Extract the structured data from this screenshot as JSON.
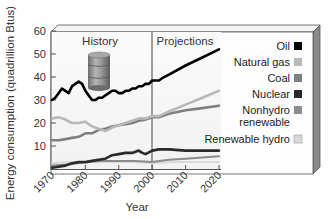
{
  "chart_data": {
    "type": "line",
    "title": "",
    "xlabel": "Year",
    "ylabel": "Energy consumption (quadrillion Btus)",
    "xlim": [
      1970,
      2020
    ],
    "ylim": [
      0,
      60
    ],
    "x_ticks": [
      1970,
      1980,
      1990,
      2000,
      2010,
      2020
    ],
    "y_ticks": [
      10,
      20,
      30,
      40,
      50,
      60
    ],
    "grid": false,
    "legend_position": "right, inside",
    "annotations": [
      {
        "text": "History",
        "x": 1984
      },
      {
        "text": "Projections",
        "x": 2009
      },
      {
        "type": "vertical-divider",
        "x": 2000
      },
      {
        "type": "oil-barrel-illustration",
        "x": 1985
      }
    ],
    "series": [
      {
        "name": "Oil",
        "color": "#000000",
        "x": [
          1970,
          1971,
          1972,
          1973,
          1974,
          1975,
          1976,
          1977,
          1978,
          1979,
          1980,
          1981,
          1982,
          1983,
          1984,
          1985,
          1986,
          1987,
          1988,
          1989,
          1990,
          1991,
          1992,
          1993,
          1994,
          1995,
          1996,
          1997,
          1998,
          1999,
          2000,
          2001,
          2002,
          2003,
          2005,
          2010,
          2015,
          2020
        ],
        "values": [
          30,
          31,
          33,
          35,
          34,
          33,
          36,
          37,
          38,
          37,
          34,
          32,
          30,
          30,
          31,
          31,
          32,
          33,
          34,
          34,
          33,
          33,
          34,
          34,
          35,
          35,
          36,
          36,
          37,
          37,
          38.5,
          38.5,
          38.5,
          39.5,
          41,
          45,
          48.5,
          52
        ]
      },
      {
        "name": "Natural gas",
        "color": "#b8b8b8",
        "x": [
          1970,
          1972,
          1974,
          1976,
          1978,
          1980,
          1982,
          1984,
          1986,
          1988,
          1990,
          1992,
          1994,
          1996,
          1998,
          2000,
          2002,
          2005,
          2010,
          2015,
          2020
        ],
        "values": [
          22,
          22.5,
          21.5,
          20,
          20,
          20.5,
          18.5,
          17.5,
          16.5,
          18,
          19,
          20,
          21,
          22,
          22,
          23,
          23,
          25,
          28,
          31,
          34
        ]
      },
      {
        "name": "Coal",
        "color": "#7f7f7f",
        "x": [
          1970,
          1972,
          1974,
          1976,
          1978,
          1980,
          1982,
          1984,
          1986,
          1988,
          1990,
          1992,
          1994,
          1996,
          1998,
          2000,
          2002,
          2005,
          2010,
          2015,
          2020
        ],
        "values": [
          12.5,
          12.5,
          13,
          13.5,
          14,
          15.5,
          15.5,
          17,
          17.5,
          18.5,
          19,
          19.5,
          20,
          21,
          21.5,
          22.5,
          22.5,
          24,
          25.5,
          26.5,
          27.5
        ]
      },
      {
        "name": "Nuclear",
        "color": "#2a2a2a",
        "x": [
          1970,
          1972,
          1974,
          1976,
          1978,
          1980,
          1982,
          1984,
          1986,
          1988,
          1990,
          1992,
          1994,
          1996,
          1997,
          1998,
          2000,
          2002,
          2005,
          2010,
          2015,
          2020
        ],
        "values": [
          0.5,
          1,
          1.5,
          2.5,
          3,
          3,
          3.5,
          4,
          4.5,
          6,
          6.5,
          7,
          7,
          8,
          7,
          6.5,
          8,
          8.5,
          8.5,
          8,
          8,
          8
        ]
      },
      {
        "name": "Nonhydro renewable",
        "color": "#8c8c8c",
        "x": [
          1970,
          1975,
          1980,
          1985,
          1990,
          1995,
          2000,
          2005,
          2010,
          2015,
          2020
        ],
        "values": [
          1.5,
          2,
          3,
          3.5,
          3.5,
          3.5,
          3,
          4,
          4.5,
          5,
          5.5
        ]
      },
      {
        "name": "Renewable hydro",
        "color": "#d9d9d9",
        "x": [
          1970,
          1975,
          1980,
          1985,
          1990,
          1995,
          2000,
          2005,
          2010,
          2015,
          2020
        ],
        "values": [
          2.5,
          3,
          3,
          3,
          3,
          3,
          2.5,
          3,
          3,
          3,
          3
        ]
      }
    ]
  },
  "labels": {
    "history": "History",
    "projections": "Projections",
    "xlabel": "Year",
    "ylabel": "Energy consumption (quadrillion Btus)"
  },
  "axes": {
    "y_ticks": [
      "10",
      "20",
      "30",
      "40",
      "50",
      "60"
    ],
    "x_ticks": [
      "1970",
      "1980",
      "1990",
      "2000",
      "2010",
      "2020"
    ]
  },
  "legend": [
    {
      "label": "Oil",
      "color": "#000000"
    },
    {
      "label": "Natural gas",
      "color": "#b8b8b8"
    },
    {
      "label": "Coal",
      "color": "#7f7f7f"
    },
    {
      "label": "Nuclear",
      "color": "#2a2a2a"
    },
    {
      "label": "Nonhydro",
      "label2": "renewable",
      "color": "#8c8c8c"
    },
    {
      "label": "Renewable hydro",
      "color": "#d9d9d9"
    }
  ]
}
